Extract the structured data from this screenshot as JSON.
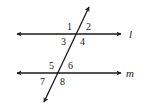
{
  "diagram": {
    "type": "parallel-lines-cut-by-transversal",
    "lines": [
      {
        "name": "l",
        "label": "l"
      },
      {
        "name": "m",
        "label": "m"
      }
    ],
    "angles": [
      {
        "number": "1",
        "position": "upper-left at l"
      },
      {
        "number": "2",
        "position": "upper-right at l"
      },
      {
        "number": "3",
        "position": "lower-left at l"
      },
      {
        "number": "4",
        "position": "lower-right at l"
      },
      {
        "number": "5",
        "position": "upper-left at m"
      },
      {
        "number": "6",
        "position": "upper-right at m"
      },
      {
        "number": "7",
        "position": "lower-left at m"
      },
      {
        "number": "8",
        "position": "lower-right at m"
      }
    ],
    "colors": {
      "stroke": "#1a1a1a",
      "background": "#ffffff"
    }
  }
}
